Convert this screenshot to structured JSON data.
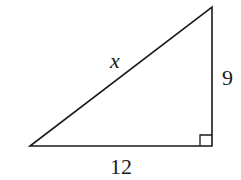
{
  "figure": {
    "type": "right-triangle",
    "vertices": {
      "bottom_left": [
        30,
        146
      ],
      "bottom_right": [
        212,
        146
      ],
      "top": [
        212,
        7
      ]
    },
    "right_angle_at": "bottom_right",
    "stroke_color": "#1a1a1a",
    "labels": {
      "hypotenuse": "x",
      "vertical_leg": "9",
      "horizontal_leg": "12"
    }
  }
}
